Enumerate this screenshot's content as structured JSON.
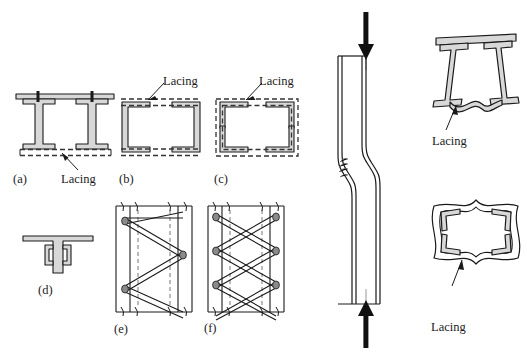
{
  "figure": {
    "kind": "engineering-diagram",
    "stroke_color": "#1a1a1a",
    "fill_color": "#d8d8d8",
    "lacing_dash_color": "#3a3a3a",
    "background": "#ffffff"
  },
  "panels": [
    {
      "id": "a",
      "caption": "(a)",
      "annotation": "Lacing",
      "description": "Two I-sections side by side joined by top batten plate and bottom lacing"
    },
    {
      "id": "b",
      "caption": "(b)",
      "annotation": "Lacing",
      "description": "Two channel sections back to back with lacing top and bottom"
    },
    {
      "id": "c",
      "caption": "(c)",
      "annotation": "Lacing",
      "description": "Four corner angles forming a box with lacing on all four faces"
    },
    {
      "id": "d",
      "caption": "(d)",
      "annotation": "",
      "description": "Tee section with two small channels attached to the stem"
    },
    {
      "id": "e",
      "caption": "(e)",
      "annotation": "",
      "description": "Elevation of single lacing system, zig-zag diagonals"
    },
    {
      "id": "f",
      "caption": "(f)",
      "annotation": "",
      "description": "Elevation of double lacing system, crossed diagonals"
    }
  ],
  "buckling_column": {
    "top_load_arrow": "compression-load-down",
    "bottom_load_arrow": "compression-load-up",
    "description": "Slender laced column under axial compression showing localised shear buckling kink at mid-height"
  },
  "deformed_sections": [
    {
      "id": "deformed-i-pair",
      "annotation": "Lacing",
      "description": "Buckled shape of the two I-section built-up column with distorted bottom lacing"
    },
    {
      "id": "deformed-box",
      "annotation": "Lacing",
      "description": "Buckled shape of the four-angle box column with distorted lacing on all faces"
    }
  ]
}
